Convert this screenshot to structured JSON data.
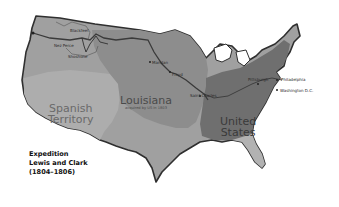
{
  "map": {
    "caption": {
      "line1": "Expedition",
      "line2": "Lewis and Clark",
      "line3": "(1804–1806)"
    },
    "regions": {
      "spanish": {
        "line1": "Spanish",
        "line2": "Territory",
        "color": "#a9a9a9"
      },
      "louisiana": {
        "title": "Louisiana",
        "subtitle": "acquired by US in 1803",
        "color": "#8c8c8c"
      },
      "united_states": {
        "line1": "United",
        "line2": "States",
        "color": "#6e6e6e"
      },
      "oregon": {
        "color": "#9a9a9a"
      },
      "other": {
        "color": "#b4b4b4"
      }
    },
    "places": {
      "blackfeet": "Blackfeet",
      "nez_perce": "Nez Perce",
      "shoshone": "Shoshone",
      "mandan": "Mandan",
      "floyd": "Floyd",
      "saint_charles": "Saint Charles",
      "pittsburgh": "Pittsburgh",
      "philadelphia": "Philadelphia",
      "washington": "Washington D.C."
    },
    "route_color": "#3a3a3a"
  }
}
